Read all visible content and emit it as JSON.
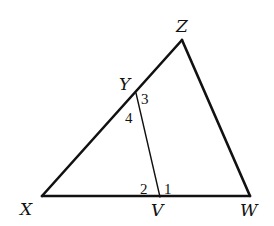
{
  "figure": {
    "type": "triangle-with-segment",
    "vertices": {
      "X": {
        "label": "X"
      },
      "Z": {
        "label": "Z"
      },
      "W": {
        "label": "W"
      }
    },
    "points": {
      "Y": {
        "label": "Y",
        "on_segment": "XZ"
      },
      "V": {
        "label": "V",
        "on_segment": "XW"
      }
    },
    "segments": [
      "XZ",
      "ZW",
      "XW",
      "YV"
    ],
    "angles": [
      {
        "label": "1",
        "at": "V",
        "between": "VW,VY"
      },
      {
        "label": "2",
        "at": "V",
        "between": "VX,VY"
      },
      {
        "label": "3",
        "at": "Y",
        "between": "YZ,YV"
      },
      {
        "label": "4",
        "at": "Y",
        "between": "YX,YV"
      }
    ],
    "stroke_color": "#111111",
    "background": "#ffffff"
  }
}
